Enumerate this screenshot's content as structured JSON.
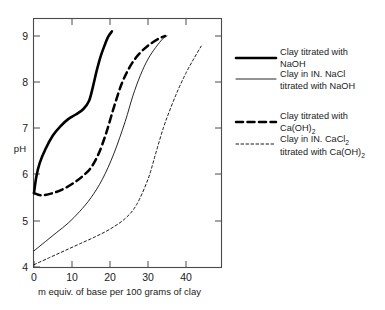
{
  "chart_data": {
    "type": "line",
    "title": "",
    "xlabel": "m equiv. of base per 100 grams of clay",
    "ylabel": "pH",
    "xlim": [
      0,
      48
    ],
    "ylim": [
      4,
      9.4
    ],
    "xticks": [
      0,
      10,
      20,
      30,
      40
    ],
    "yticks": [
      4,
      5,
      6,
      7,
      8,
      9
    ],
    "grid": false,
    "legend_position": "right",
    "series": [
      {
        "name": "Clay titrated with NaOH",
        "style": "thick-solid",
        "x": [
          0,
          0.6,
          1.5,
          3,
          5,
          7,
          9,
          11,
          13,
          14.5,
          15.5,
          16.5,
          17.5,
          18.5,
          19.5,
          20.5
        ],
        "y": [
          5.6,
          5.95,
          6.25,
          6.55,
          6.85,
          7.05,
          7.2,
          7.3,
          7.42,
          7.6,
          7.9,
          8.25,
          8.55,
          8.78,
          8.98,
          9.1
        ]
      },
      {
        "name": "Clay in IN. NaCl titrated with NaOH",
        "style": "thin-solid",
        "x": [
          0,
          3,
          6,
          9,
          12,
          15,
          18,
          21,
          24,
          26,
          28,
          30,
          32,
          34,
          35
        ],
        "y": [
          4.35,
          4.55,
          4.75,
          4.95,
          5.2,
          5.5,
          5.9,
          6.45,
          7.15,
          7.7,
          8.15,
          8.5,
          8.75,
          8.95,
          9.0
        ]
      },
      {
        "name": "Clay titrated with Ca(OH)2",
        "style": "thick-dash",
        "x": [
          0,
          2,
          5,
          8,
          11,
          13,
          15,
          17,
          19,
          21,
          23,
          25,
          27,
          29,
          31,
          33,
          34.5
        ],
        "y": [
          5.6,
          5.55,
          5.6,
          5.7,
          5.85,
          5.98,
          6.15,
          6.45,
          6.9,
          7.45,
          7.95,
          8.3,
          8.55,
          8.72,
          8.85,
          8.95,
          9.0
        ]
      },
      {
        "name": "Clay in IN. CaCl2 titrated with Ca(OH)2",
        "style": "thin-dot",
        "x": [
          0,
          4,
          8,
          12,
          16,
          20,
          24,
          27,
          30,
          32,
          34,
          36,
          38,
          40,
          42,
          44
        ],
        "y": [
          4.05,
          4.2,
          4.35,
          4.5,
          4.65,
          4.82,
          5.05,
          5.35,
          5.9,
          6.45,
          7.0,
          7.45,
          7.85,
          8.2,
          8.5,
          8.78
        ]
      }
    ]
  },
  "axes": {
    "ylabel": "pH",
    "xlabel": "m equiv. of base per 100 grams of clay",
    "xticks": [
      "0",
      "10",
      "20",
      "30",
      "40"
    ],
    "yticks": [
      "9",
      "8",
      "7",
      "6",
      "5",
      "4"
    ]
  },
  "legend": {
    "items": [
      {
        "style": "thick-solid",
        "line1": "Clay titrated with",
        "line2": "NaOH",
        "line2_sub": "",
        "line2_tail": ""
      },
      {
        "style": "thin-solid",
        "line1": "Clay in IN. NaCl",
        "line2": "titrated with NaOH",
        "line2_sub": "",
        "line2_tail": ""
      },
      {
        "style": "thick-dash",
        "line1": "Clay titrated with",
        "line2": "Ca(OH)",
        "line2_sub": "2",
        "line2_tail": ""
      },
      {
        "style": "thin-dot",
        "line1_pre": "Clay in IN. CaCl",
        "line1_sub": "2",
        "line2_pre": "titrated with Ca(OH)",
        "line2_sub": "2",
        "line2_tail": ""
      }
    ]
  },
  "colors": {
    "curve": "#000000",
    "frame": "#4a4a4a",
    "background": "#ffffff"
  }
}
